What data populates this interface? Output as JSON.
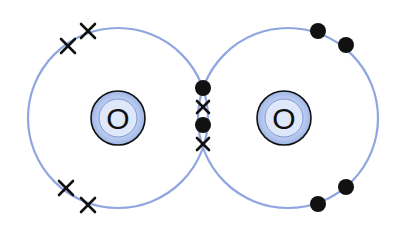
{
  "diagram": {
    "type": "dot-and-cross",
    "molecule": "O2",
    "colors": {
      "shell": "#8fa6e0",
      "electron": "#111111",
      "nucleus_fill_inner": "#e8efff",
      "nucleus_fill_outer": "#a9bfea"
    },
    "atoms": [
      {
        "label": "O",
        "center": [
          118,
          118
        ],
        "shell_radius": 90,
        "electron_symbol": "cross",
        "lone_electrons": [
          [
            68,
            46
          ],
          [
            88,
            31
          ],
          [
            66,
            188
          ],
          [
            88,
            205
          ]
        ]
      },
      {
        "label": "O",
        "center": [
          288,
          118
        ],
        "shell_radius": 90,
        "electron_symbol": "dot",
        "lone_electrons": [
          [
            318,
            31
          ],
          [
            346,
            45
          ],
          [
            346,
            187
          ],
          [
            318,
            204
          ]
        ]
      }
    ],
    "shared_electrons": [
      {
        "symbol": "dot",
        "pos": [
          203,
          88
        ]
      },
      {
        "symbol": "cross",
        "pos": [
          203,
          107
        ]
      },
      {
        "symbol": "dot",
        "pos": [
          203,
          125
        ]
      },
      {
        "symbol": "cross",
        "pos": [
          203,
          144
        ]
      }
    ]
  }
}
